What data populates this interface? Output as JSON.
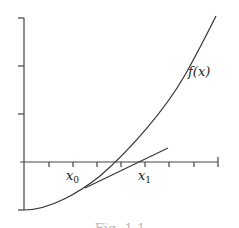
{
  "figure": {
    "caption": "Fig. 1.1",
    "function_label": "f(x)",
    "labels": {
      "x0": {
        "base": "x",
        "sub": "0"
      },
      "x1": {
        "base": "x",
        "sub": "1"
      }
    },
    "colors": {
      "line": "#333333",
      "axis": "#444444",
      "caption": "#bbbbbb"
    }
  }
}
